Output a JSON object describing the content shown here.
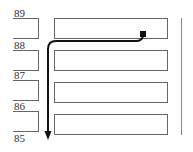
{
  "diagram": {
    "row_labels": [
      "89",
      "88",
      "87",
      "86",
      "85"
    ],
    "stubs": [
      {
        "top": 18,
        "height": 19
      },
      {
        "top": 50,
        "height": 19
      },
      {
        "top": 80,
        "height": 19
      },
      {
        "top": 111,
        "height": 19
      }
    ],
    "boxes": [
      {
        "top": 18,
        "height": 19
      },
      {
        "top": 50,
        "height": 19
      },
      {
        "top": 80,
        "height": 19
      },
      {
        "top": 111,
        "height": 19
      }
    ],
    "path": {
      "start": "square-marker",
      "end": "arrowhead-down",
      "color": "#111111"
    },
    "colors": {
      "line": "#666666",
      "path": "#111111"
    }
  }
}
